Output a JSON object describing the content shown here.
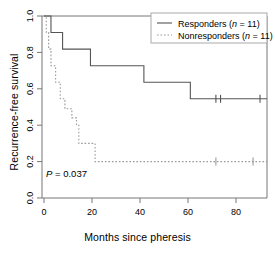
{
  "chart_data": {
    "type": "line",
    "subtype": "kaplan-meier-step",
    "title": "",
    "xlabel": "Months since pheresis",
    "ylabel": "Recurrence-free survival",
    "xlim": [
      0,
      96
    ],
    "ylim": [
      0.0,
      1.0
    ],
    "xticks": [
      0,
      20,
      40,
      60,
      80
    ],
    "xtick_labels": [
      "0",
      "20",
      "40",
      "60",
      "80"
    ],
    "yticks": [
      0.0,
      0.2,
      0.4,
      0.6,
      0.8,
      1.0
    ],
    "ytick_labels": [
      "0.0",
      "0.2",
      "0.4",
      "0.6",
      "0.8",
      "1.0"
    ],
    "grid": false,
    "annotations": [
      {
        "name": "p-value",
        "prefix_italic": "P",
        "text": " = 0.037",
        "full_text": "P = 0.037",
        "x": 2,
        "y": 0.205
      }
    ],
    "series": [
      {
        "name": "Responders",
        "n": 11,
        "legend_label": "Responders (n = 11)",
        "linestyle": "solid",
        "color": "#555555",
        "steps_x": [
          0,
          3,
          3,
          8,
          8,
          20,
          20,
          43,
          43,
          63,
          63,
          96
        ],
        "steps_y": [
          1.0,
          1.0,
          0.909,
          0.909,
          0.818,
          0.818,
          0.727,
          0.727,
          0.636,
          0.636,
          0.545,
          0.545
        ],
        "censor_x": [
          74,
          76,
          93
        ],
        "censor_y": [
          0.545,
          0.545,
          0.545
        ]
      },
      {
        "name": "Nonresponders",
        "n": 11,
        "legend_label": "Nonresponders (n = 11)",
        "linestyle": "dotted",
        "color": "#888888",
        "steps_x": [
          0,
          1,
          1,
          2,
          2,
          3,
          3,
          5,
          5,
          7,
          7,
          9,
          9,
          12,
          12,
          14,
          14,
          15,
          15,
          22,
          22,
          96
        ],
        "steps_y": [
          1.0,
          1.0,
          0.909,
          0.909,
          0.818,
          0.818,
          0.727,
          0.727,
          0.636,
          0.636,
          0.545,
          0.545,
          0.49,
          0.49,
          0.44,
          0.44,
          0.4,
          0.4,
          0.3,
          0.3,
          0.2,
          0.2
        ],
        "censor_x": [
          74,
          90
        ],
        "censor_y": [
          0.2,
          0.2
        ]
      }
    ],
    "legend": {
      "position": "top-right",
      "entries": [
        "Responders (n = 11)",
        "Nonresponders (n = 11)"
      ]
    }
  },
  "legend": {
    "responders_name": "Responders",
    "responders_n": "(n = 11)",
    "nonresponders_name": "Nonresponders",
    "nonresponders_n": "(n = 11)"
  },
  "axes": {
    "x_title": "Months since pheresis",
    "y_title": "Recurrence-free survival",
    "x_tick_0": "0",
    "x_tick_1": "20",
    "x_tick_2": "40",
    "x_tick_3": "60",
    "x_tick_4": "80",
    "y_tick_0": "0.0",
    "y_tick_1": "0.2",
    "y_tick_2": "0.4",
    "y_tick_3": "0.6",
    "y_tick_4": "0.8",
    "y_tick_5": "1.0"
  },
  "annotation": {
    "p_italic": "P",
    "p_value": " = 0.037"
  },
  "colors": {
    "axis": "#555555",
    "responders_line": "#555555",
    "nonresponders_line": "#999999",
    "text": "#000000"
  }
}
